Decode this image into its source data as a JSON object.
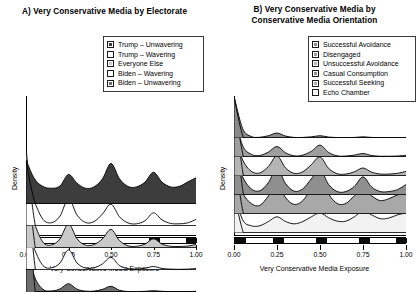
{
  "figure": {
    "axis_label_x": "Very Conservative Media Exposure",
    "axis_label_y": "Density",
    "tick_labels": [
      "0.00",
      "0.25",
      "0.50",
      "0.75",
      "1.00"
    ]
  },
  "panel_a": {
    "title": "A) Very Conservative Media by Electorate",
    "legend": [
      {
        "label": "Trump – Unwavering",
        "color": "#3d3d3d"
      },
      {
        "label": "Trump – Wavering",
        "color": "#ffffff"
      },
      {
        "label": "Everyone Else",
        "color": "#c9c9c9"
      },
      {
        "label": "Biden – Wavering",
        "color": "#fafafa"
      },
      {
        "label": "Biden – Unwavering",
        "color": "#6e6e6e"
      }
    ]
  },
  "panel_b": {
    "title_line1": "B) Very Conservative Media by",
    "title_line2": "Conservative Media Orientation",
    "legend": [
      {
        "label": "Successful Avoidance",
        "color": "#8a8a8a"
      },
      {
        "label": "Disengaged",
        "color": "#9e9e9e"
      },
      {
        "label": "Unsuccessful Avoidance",
        "color": "#b5b5b5"
      },
      {
        "label": "Casual Consumption",
        "color": "#8f8f8f"
      },
      {
        "label": "Successful Seeking",
        "color": "#a8a8a8"
      },
      {
        "label": "Echo Chamber",
        "color": "#f2f2f2"
      }
    ]
  },
  "chart_data": {
    "type": "area",
    "xlabel": "Very Conservative Media Exposure",
    "ylabel": "Density",
    "xlim": [
      0.0,
      1.0
    ],
    "xticks": [
      0.0,
      0.25,
      0.5,
      0.75,
      1.0
    ],
    "grid": false,
    "legend_position": "top-right",
    "panels": [
      {
        "panel": "A",
        "title": "A) Very Conservative Media by Electorate",
        "series": [
          {
            "name": "Trump – Unwavering",
            "fill": "#3d3d3d",
            "row": 1,
            "peak_at_zero": 2.0,
            "x": [
              0.0,
              0.05,
              0.1,
              0.15,
              0.2,
              0.25,
              0.3,
              0.35,
              0.4,
              0.45,
              0.5,
              0.55,
              0.6,
              0.65,
              0.7,
              0.75,
              0.8,
              0.85,
              0.9,
              0.95,
              1.0
            ],
            "values": [
              2.0,
              1.15,
              0.8,
              0.72,
              0.82,
              1.35,
              0.95,
              0.72,
              0.78,
              1.15,
              1.85,
              1.15,
              0.8,
              0.78,
              1.0,
              1.45,
              1.0,
              0.78,
              0.8,
              1.0,
              1.2
            ]
          },
          {
            "name": "Trump – Wavering",
            "fill": "#ffffff",
            "row": 2,
            "peak_at_zero": 3.6,
            "x": [
              0.0,
              0.05,
              0.1,
              0.15,
              0.2,
              0.25,
              0.3,
              0.35,
              0.4,
              0.45,
              0.5,
              0.55,
              0.6,
              0.65,
              0.7,
              0.75,
              0.8,
              0.85,
              0.9,
              0.95,
              1.0
            ],
            "values": [
              3.6,
              1.1,
              0.3,
              0.15,
              0.45,
              1.25,
              0.5,
              0.16,
              0.2,
              0.55,
              1.0,
              0.42,
              0.14,
              0.1,
              0.24,
              0.6,
              0.28,
              0.12,
              0.1,
              0.14,
              0.3
            ]
          },
          {
            "name": "Everyone Else",
            "fill": "#c9c9c9",
            "row": 3,
            "peak_at_zero": 4.4,
            "x": [
              0.0,
              0.05,
              0.1,
              0.15,
              0.2,
              0.25,
              0.3,
              0.35,
              0.4,
              0.45,
              0.5,
              0.55,
              0.6,
              0.65,
              0.7,
              0.75,
              0.8,
              0.85,
              0.9,
              0.95,
              1.0
            ],
            "values": [
              4.4,
              1.1,
              0.26,
              0.14,
              0.42,
              1.1,
              0.42,
              0.13,
              0.16,
              0.42,
              0.85,
              0.34,
              0.1,
              0.08,
              0.18,
              0.42,
              0.18,
              0.08,
              0.07,
              0.09,
              0.16
            ]
          },
          {
            "name": "Biden – Wavering",
            "fill": "#fafafa",
            "row": 4,
            "peak_at_zero": 5.0,
            "x": [
              0.0,
              0.05,
              0.1,
              0.15,
              0.2,
              0.25,
              0.3,
              0.35,
              0.4,
              0.45,
              0.5,
              0.55,
              0.6,
              0.65,
              0.7,
              0.75,
              0.8,
              0.85,
              0.9,
              0.95,
              1.0
            ],
            "values": [
              5.0,
              0.95,
              0.2,
              0.1,
              0.32,
              0.92,
              0.32,
              0.09,
              0.1,
              0.28,
              0.58,
              0.2,
              0.06,
              0.04,
              0.08,
              0.16,
              0.07,
              0.04,
              0.03,
              0.04,
              0.07
            ]
          },
          {
            "name": "Biden – Unwavering",
            "fill": "#6e6e6e",
            "row": 5,
            "peak_at_zero": 6.0,
            "x": [
              0.0,
              0.05,
              0.1,
              0.15,
              0.2,
              0.25,
              0.3,
              0.35,
              0.4,
              0.45,
              0.5,
              0.55,
              0.6,
              0.65,
              0.7,
              0.75,
              0.8,
              0.85,
              0.9,
              0.95,
              1.0
            ],
            "values": [
              6.0,
              0.7,
              0.12,
              0.05,
              0.14,
              0.38,
              0.13,
              0.04,
              0.04,
              0.12,
              0.26,
              0.08,
              0.02,
              0.02,
              0.03,
              0.06,
              0.03,
              0.02,
              0.02,
              0.02,
              0.03
            ]
          }
        ]
      },
      {
        "panel": "B",
        "title": "B) Very Conservative Media by Conservative Media Orientation",
        "series": [
          {
            "name": "Successful Avoidance",
            "fill": "#8a8a8a",
            "row": 1,
            "peak_at_zero": 6.5,
            "x": [
              0.0,
              0.05,
              0.1,
              0.15,
              0.2,
              0.25,
              0.3,
              0.35,
              0.4,
              0.45,
              0.5,
              0.55,
              0.6,
              0.65,
              0.7,
              0.75,
              0.8,
              0.85,
              0.9,
              0.95,
              1.0
            ],
            "values": [
              6.5,
              0.5,
              0.08,
              0.04,
              0.12,
              0.26,
              0.1,
              0.03,
              0.03,
              0.06,
              0.12,
              0.05,
              0.02,
              0.02,
              0.03,
              0.06,
              0.03,
              0.02,
              0.02,
              0.02,
              0.03
            ]
          },
          {
            "name": "Disengaged",
            "fill": "#9e9e9e",
            "row": 2,
            "peak_at_zero": 6.0,
            "x": [
              0.0,
              0.05,
              0.1,
              0.15,
              0.2,
              0.25,
              0.3,
              0.35,
              0.4,
              0.45,
              0.5,
              0.55,
              0.6,
              0.65,
              0.7,
              0.75,
              0.8,
              0.85,
              0.9,
              0.95,
              1.0
            ],
            "values": [
              6.0,
              0.6,
              0.14,
              0.08,
              0.26,
              0.55,
              0.22,
              0.06,
              0.1,
              0.3,
              0.62,
              0.24,
              0.06,
              0.05,
              0.1,
              0.18,
              0.08,
              0.04,
              0.04,
              0.05,
              0.09
            ]
          },
          {
            "name": "Unsuccessful Avoidance",
            "fill": "#b5b5b5",
            "row": 3,
            "peak_at_zero": 5.4,
            "x": [
              0.0,
              0.05,
              0.1,
              0.15,
              0.2,
              0.25,
              0.3,
              0.35,
              0.4,
              0.45,
              0.5,
              0.55,
              0.6,
              0.65,
              0.7,
              0.75,
              0.8,
              0.85,
              0.9,
              0.95,
              1.0
            ],
            "values": [
              5.4,
              0.85,
              0.25,
              0.16,
              0.5,
              1.05,
              0.42,
              0.14,
              0.22,
              0.6,
              1.0,
              0.4,
              0.12,
              0.1,
              0.22,
              0.42,
              0.2,
              0.1,
              0.1,
              0.14,
              0.24
            ]
          },
          {
            "name": "Casual Consumption",
            "fill": "#8f8f8f",
            "row": 4,
            "peak_at_zero": 4.6,
            "x": [
              0.0,
              0.05,
              0.1,
              0.15,
              0.2,
              0.25,
              0.3,
              0.35,
              0.4,
              0.45,
              0.5,
              0.55,
              0.6,
              0.65,
              0.7,
              0.75,
              0.8,
              0.85,
              0.9,
              0.95,
              1.0
            ],
            "values": [
              4.6,
              0.95,
              0.32,
              0.22,
              0.65,
              1.4,
              0.6,
              0.2,
              0.32,
              0.85,
              1.35,
              0.55,
              0.18,
              0.18,
              0.45,
              0.95,
              0.42,
              0.18,
              0.18,
              0.28,
              0.55
            ]
          },
          {
            "name": "Successful Seeking",
            "fill": "#a8a8a8",
            "row": 5,
            "peak_at_zero": 3.4,
            "x": [
              0.0,
              0.05,
              0.1,
              0.15,
              0.2,
              0.25,
              0.3,
              0.35,
              0.4,
              0.45,
              0.5,
              0.55,
              0.6,
              0.65,
              0.7,
              0.75,
              0.8,
              0.85,
              0.9,
              0.95,
              1.0
            ],
            "values": [
              3.4,
              1.1,
              0.55,
              0.45,
              0.95,
              1.65,
              0.85,
              0.5,
              0.7,
              1.35,
              2.0,
              1.05,
              0.55,
              0.55,
              0.95,
              1.3,
              0.95,
              0.7,
              0.8,
              1.0,
              1.1
            ]
          },
          {
            "name": "Echo Chamber",
            "fill": "#f2f2f2",
            "row": 6,
            "peak_at_zero": 2.2,
            "x": [
              0.0,
              0.05,
              0.1,
              0.15,
              0.2,
              0.25,
              0.3,
              0.35,
              0.4,
              0.45,
              0.5,
              0.55,
              0.6,
              0.65,
              0.7,
              0.75,
              0.8,
              0.85,
              0.9,
              0.95,
              1.0
            ],
            "values": [
              2.2,
              0.7,
              0.38,
              0.38,
              0.6,
              0.85,
              0.6,
              0.48,
              0.6,
              0.85,
              1.05,
              0.8,
              0.62,
              0.62,
              0.85,
              1.15,
              0.95,
              0.75,
              0.78,
              0.95,
              1.05
            ]
          }
        ]
      }
    ]
  }
}
